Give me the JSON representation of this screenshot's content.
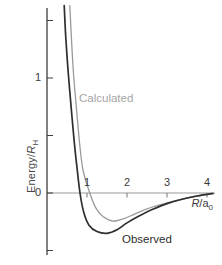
{
  "figure": {
    "background": "#ffffff",
    "ylabel": {
      "prefix": "Energy/",
      "symbol": "R",
      "subscript": "H"
    },
    "xlabel": {
      "symbol": "R",
      "divider": "/a",
      "subscript": "0"
    },
    "annotations": {
      "calculated_label": "Calculated",
      "observed_label": "Observed"
    },
    "colors": {
      "observed_curve": "#2f2f2f",
      "calculated_curve": "#9a9a9a",
      "calculated_label_color": "#a5a5a5",
      "observed_label_color": "#2d2d2d",
      "y_axis": "#3d3d3d",
      "zero_line": "#999999",
      "x_tick": "#777777",
      "tick_label": "#3a3a3a"
    }
  },
  "chart_data": {
    "type": "line",
    "title": "",
    "xlabel": "R/a0",
    "ylabel": "Energy/RH",
    "xlim": [
      0,
      4.2
    ],
    "ylim": [
      -0.54,
      1.68
    ],
    "x_ticks": [
      1,
      2,
      3,
      4
    ],
    "x_tick_labels": [
      "1",
      "2",
      "3",
      "4"
    ],
    "y_ticks": [
      1,
      0
    ],
    "y_tick_labels": [
      "1",
      "0"
    ],
    "y_minor_ticks": [
      1.5,
      0.5,
      -0.5
    ],
    "grid": false,
    "legend": "inline-labels",
    "series": [
      {
        "name": "Calculated",
        "color": "#9a9a9a",
        "stroke_width": 1.3,
        "points": [
          [
            0.57,
            1.63
          ],
          [
            0.61,
            1.35
          ],
          [
            0.66,
            1.05
          ],
          [
            0.73,
            0.76
          ],
          [
            0.81,
            0.45
          ],
          [
            0.9,
            0.2
          ],
          [
            1.07,
            0
          ],
          [
            1.22,
            -0.13
          ],
          [
            1.4,
            -0.205
          ],
          [
            1.65,
            -0.245
          ],
          [
            1.9,
            -0.225
          ],
          [
            2.15,
            -0.19
          ],
          [
            2.45,
            -0.145
          ],
          [
            2.75,
            -0.11
          ],
          [
            3.05,
            -0.083
          ],
          [
            3.4,
            -0.052
          ],
          [
            3.75,
            -0.026
          ],
          [
            4.15,
            -0.004
          ]
        ]
      },
      {
        "name": "Observed",
        "color": "#2f2f2f",
        "stroke_width": 1.7,
        "points": [
          [
            0.43,
            1.63
          ],
          [
            0.47,
            1.35
          ],
          [
            0.53,
            1.05
          ],
          [
            0.6,
            0.76
          ],
          [
            0.68,
            0.45
          ],
          [
            0.75,
            0.22
          ],
          [
            0.825,
            0
          ],
          [
            0.92,
            -0.17
          ],
          [
            1.05,
            -0.28
          ],
          [
            1.25,
            -0.335
          ],
          [
            1.5,
            -0.35
          ],
          [
            1.75,
            -0.32
          ],
          [
            2.0,
            -0.26
          ],
          [
            2.3,
            -0.2
          ],
          [
            2.6,
            -0.148
          ],
          [
            3.0,
            -0.092
          ],
          [
            3.4,
            -0.052
          ],
          [
            3.75,
            -0.026
          ],
          [
            4.15,
            -0.004
          ]
        ]
      }
    ]
  }
}
